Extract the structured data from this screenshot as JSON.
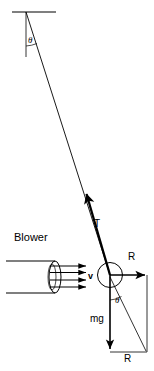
{
  "figure": {
    "type": "physics-free-body-diagram",
    "background_color": "#ffffff",
    "stroke_color": "#000000",
    "width": 154,
    "height": 371
  },
  "labels": {
    "theta_top": "θ",
    "theta_bottom": "θ",
    "tension": "T",
    "reaction_top": "R",
    "reaction_bottom": "R",
    "weight": "mg",
    "velocity": "v",
    "blower": "Blower"
  },
  "elements": {
    "ceiling": {
      "name": "ceiling-support-line",
      "x1": 12,
      "y1": 12,
      "x2": 56,
      "y2": 12
    },
    "pivot": {
      "x": 26,
      "y": 12
    },
    "vertical_reference": {
      "name": "vertical-reference-line",
      "x1": 26,
      "y1": 12,
      "x2": 26,
      "y2": 57
    },
    "string": {
      "name": "pendulum-string",
      "x1": 26,
      "y1": 12,
      "x2": 110,
      "y2": 275
    },
    "ball": {
      "name": "pendulum-ball",
      "cx": 110,
      "cy": 275,
      "r": 13
    },
    "tension_vector": {
      "name": "tension-vector",
      "from": [
        110,
        275
      ],
      "to": [
        85,
        192
      ]
    },
    "reaction_vector": {
      "name": "reaction-vector-horizontal",
      "from": [
        110,
        275
      ],
      "to": [
        147,
        275
      ]
    },
    "weight_vector": {
      "name": "weight-vector",
      "from": [
        110,
        275
      ],
      "to": [
        110,
        352
      ]
    },
    "resultant_line": {
      "name": "resultant-diagonal",
      "from": [
        110,
        275
      ],
      "to": [
        147,
        352
      ]
    },
    "parallelogram": {
      "name": "force-parallelogram",
      "right_side": [
        147,
        275,
        147,
        352
      ],
      "bottom_side": [
        110,
        352,
        147,
        352
      ]
    },
    "blower_duct": {
      "name": "blower-duct",
      "ellipse_cx": 55,
      "ellipse_cy": 277,
      "rx": 6,
      "ry": 16
    },
    "airflow_arrows": {
      "name": "airflow-arrows",
      "count": 4,
      "x_start": 55,
      "x_end": 88,
      "y_values": [
        266,
        272,
        279,
        285
      ]
    }
  },
  "label_positions": {
    "theta_top": {
      "x": 28,
      "y": 40
    },
    "theta_bottom": {
      "x": 116,
      "y": 300
    },
    "tension": {
      "x": 97,
      "y": 226
    },
    "reaction_top": {
      "x": 131,
      "y": 258
    },
    "reaction_bottom": {
      "x": 125,
      "y": 356
    },
    "weight": {
      "x": 92,
      "y": 320
    },
    "velocity": {
      "x": 90,
      "y": 272
    },
    "blower": {
      "x": 14,
      "y": 238
    }
  }
}
